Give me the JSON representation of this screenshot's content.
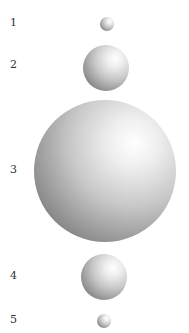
{
  "figure": {
    "items": [
      {
        "label": "1",
        "cx": 107,
        "cy": 24,
        "r": 7
      },
      {
        "label": "2",
        "cx": 106,
        "cy": 68,
        "r": 23
      },
      {
        "label": "3",
        "cx": 105,
        "cy": 171,
        "r": 71
      },
      {
        "label": "4",
        "cx": 104,
        "cy": 277,
        "r": 23
      },
      {
        "label": "5",
        "cx": 104,
        "cy": 321,
        "r": 7
      }
    ]
  }
}
